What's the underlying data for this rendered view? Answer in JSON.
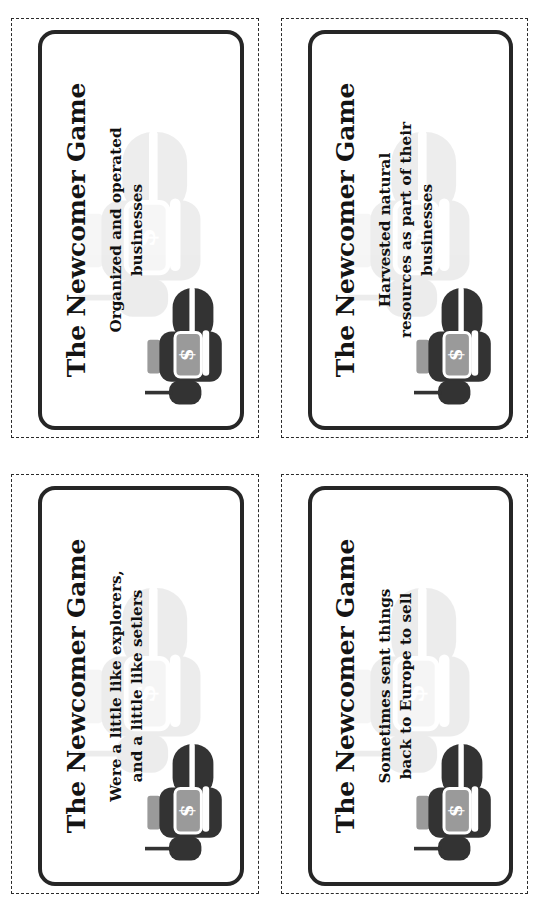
{
  "page": {
    "title": "The Newcomer Game",
    "sheet_kind": "printable-card-sheet",
    "card_count": 4,
    "colors": {
      "ink": "#141414",
      "card_border": "#262626",
      "cut_line": "#2b2b2b",
      "icon_dark": "#333333",
      "icon_gray": "#9a9a9a",
      "paper": "#ffffff"
    }
  },
  "icon": {
    "name": "hand-holding-money-icon",
    "symbol": "$"
  },
  "cards": [
    {
      "title": "The Newcomer Game",
      "prompt": "Organized and operated businesses",
      "icon": "hand-holding-money-icon"
    },
    {
      "title": "The Newcomer Game",
      "prompt": "Harvested natural resources as part of their businesses",
      "icon": "hand-holding-money-icon"
    },
    {
      "title": "The Newcomer Game",
      "prompt": "Were a little like explorers, and a little like setlers",
      "icon": "hand-holding-money-icon"
    },
    {
      "title": "The Newcomer Game",
      "prompt": "Sometimes sent things back to Europe to sell",
      "icon": "hand-holding-money-icon"
    }
  ]
}
